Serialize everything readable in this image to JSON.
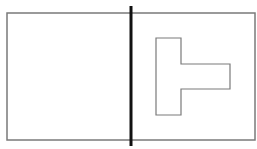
{
  "diagram": {
    "type": "geometry-figure",
    "canvas": {
      "width": 257,
      "height": 149,
      "background": "#ffffff"
    },
    "outer_rectangle": {
      "x": 7,
      "y": 13,
      "width": 248,
      "height": 127,
      "stroke": "#7a7a7a",
      "stroke_width": 1.5
    },
    "divider_line": {
      "x": 131,
      "y1": 6,
      "y2": 146,
      "stroke": "#111111",
      "stroke_width": 3
    },
    "t_shape": {
      "points": "156,38 181,38 181,64 230,64 230,89 181,89 181,115 156,115",
      "stroke": "#7a7a7a",
      "stroke_width": 1.2,
      "fill": "none"
    }
  }
}
